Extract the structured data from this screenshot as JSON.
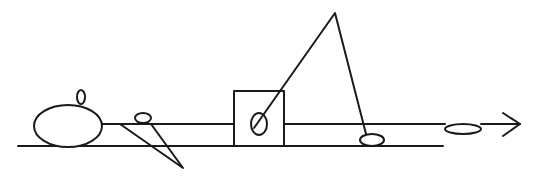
{
  "diagram": {
    "width": 535,
    "height": 183,
    "stroke_color": "#1a1a1a",
    "background": "#ffffff",
    "lines": {
      "upper_rail": {
        "x1": 102,
        "y1": 124,
        "x2": 234,
        "y2": 124,
        "x3": 284,
        "x4": 503
      },
      "lower_rail": {
        "x1": 18,
        "y1": 146,
        "x2": 443,
        "y2": 146
      }
    },
    "shapes": [
      {
        "id": "large-body",
        "type": "ellipse",
        "cx": 68,
        "cy": 126,
        "rx": 34,
        "ry": 21
      },
      {
        "id": "head-knob",
        "type": "ellipse",
        "cx": 81,
        "cy": 97,
        "rx": 4,
        "ry": 7
      },
      {
        "id": "small-pulley",
        "type": "ellipse",
        "cx": 143,
        "cy": 118,
        "rx": 8,
        "ry": 5
      },
      {
        "id": "box",
        "type": "rect",
        "x": 234,
        "y": 91,
        "width": 50,
        "height": 55
      },
      {
        "id": "box-pivot",
        "type": "ellipse",
        "cx": 259,
        "cy": 124,
        "rx": 8,
        "ry": 11
      },
      {
        "id": "right-foot",
        "type": "ellipse",
        "cx": 372,
        "cy": 140,
        "rx": 12,
        "ry": 6
      },
      {
        "id": "rail-slider",
        "type": "ellipse",
        "cx": 463,
        "cy": 129,
        "rx": 18,
        "ry": 5
      }
    ],
    "triangle_left": {
      "points": [
        [
          120,
          124
        ],
        [
          183,
          168
        ],
        [
          151,
          124
        ]
      ]
    },
    "triangle_tall": {
      "apex": [
        335,
        13
      ],
      "left_end": [
        254,
        128
      ],
      "right_end": [
        366,
        134
      ]
    },
    "arrow": {
      "tail_x": 481,
      "y": 124,
      "tip_x": 520,
      "head_top": [
        503,
        113
      ],
      "head_bottom": [
        503,
        136
      ]
    }
  }
}
